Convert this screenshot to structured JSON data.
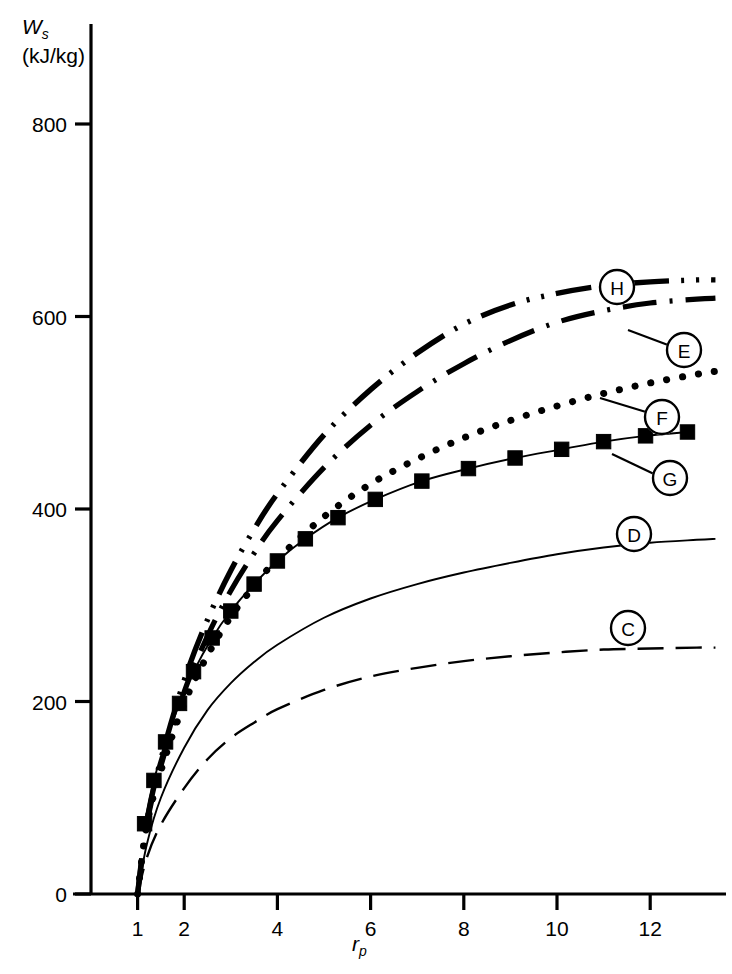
{
  "chart_data": {
    "type": "line",
    "title": "",
    "subtitle": "",
    "xlabel": "r_p",
    "xlabel_symbol": "r",
    "xlabel_subscript": "p",
    "ylabel": "W_s (kJ/kg)",
    "ylabel_symbol": "W",
    "ylabel_subscript": "s",
    "ylabel_units": "(kJ/kg)",
    "xlim": [
      0,
      13.6
    ],
    "ylim": [
      0,
      880
    ],
    "xticks": [
      1,
      2,
      4,
      6,
      8,
      10,
      12
    ],
    "xtick_labels": [
      "1",
      "2",
      "4",
      "6",
      "8",
      "10",
      "12"
    ],
    "yticks": [
      0,
      200,
      400,
      600,
      800
    ],
    "ytick_labels": [
      "0",
      "200",
      "400",
      "600",
      "800"
    ],
    "grid": false,
    "legend_position": "inline-callouts",
    "series": [
      {
        "name": "C",
        "label": "C",
        "style": "dashed-thin",
        "marker": "none",
        "x": [
          1,
          1.2,
          1.5,
          2,
          2.5,
          3,
          3.5,
          4,
          5,
          6,
          7,
          8,
          9,
          10,
          11,
          12,
          13,
          13.4
        ],
        "values": [
          0,
          38,
          72,
          110,
          140,
          162,
          178,
          192,
          212,
          226,
          235,
          242,
          247,
          251,
          254,
          255,
          256,
          256
        ]
      },
      {
        "name": "D",
        "label": "D",
        "style": "solid-thin",
        "marker": "none",
        "x": [
          1,
          1.2,
          1.5,
          2,
          2.5,
          3,
          3.5,
          4,
          5,
          6,
          7,
          8,
          9,
          10,
          11,
          12,
          13,
          13.4
        ],
        "values": [
          0,
          52,
          100,
          152,
          191,
          219,
          241,
          259,
          287,
          307,
          322,
          334,
          344,
          353,
          360,
          365,
          368,
          369
        ]
      },
      {
        "name": "G",
        "label": "G",
        "style": "solid-thin",
        "marker": "filled-square",
        "x": [
          1.15,
          1.35,
          1.6,
          1.9,
          2.2,
          2.6,
          3.0,
          3.5,
          4.0,
          4.6,
          5.3,
          6.1,
          7.1,
          8.1,
          9.1,
          10.1,
          11.0,
          11.9,
          12.8
        ],
        "values": [
          73,
          118,
          158,
          198,
          231,
          266,
          294,
          322,
          346,
          369,
          391,
          410,
          429,
          442,
          453,
          462,
          470,
          476,
          480
        ]
      },
      {
        "name": "F",
        "label": "F",
        "style": "dotted-thick",
        "marker": "none",
        "x": [
          1,
          1.2,
          1.5,
          2,
          2.5,
          3,
          3.5,
          4,
          5,
          6,
          7,
          8,
          9,
          10,
          11,
          12,
          13,
          13.4
        ],
        "values": [
          0,
          72,
          128,
          198,
          248,
          288,
          320,
          348,
          392,
          426,
          452,
          474,
          492,
          507,
          520,
          531,
          540,
          543
        ]
      },
      {
        "name": "E",
        "label": "E",
        "style": "dash-dot-thick",
        "marker": "none",
        "x": [
          1,
          1.2,
          1.5,
          2,
          2.5,
          3,
          3.5,
          4,
          5,
          6,
          7,
          8,
          9,
          10,
          11,
          12,
          13,
          13.4
        ],
        "values": [
          0,
          73,
          133,
          210,
          268,
          315,
          354,
          388,
          443,
          487,
          522,
          551,
          575,
          594,
          606,
          614,
          618,
          619
        ]
      },
      {
        "name": "H",
        "label": "H",
        "style": "dash-dot-dot-thick",
        "marker": "none",
        "x": [
          1,
          1.2,
          1.5,
          2,
          2.5,
          3,
          3.5,
          4,
          5,
          6,
          7,
          8,
          9,
          10,
          11,
          12,
          13,
          13.4
        ],
        "values": [
          0,
          76,
          140,
          222,
          285,
          336,
          379,
          416,
          477,
          524,
          562,
          592,
          612,
          624,
          632,
          636,
          638,
          638
        ]
      }
    ],
    "annotations": [
      {
        "label": "H",
        "cx": 617,
        "cy": 287,
        "leader": false
      },
      {
        "label": "E",
        "cx": 684,
        "cy": 350,
        "leader": true
      },
      {
        "label": "F",
        "cx": 662,
        "cy": 417,
        "leader": true
      },
      {
        "label": "G",
        "cx": 670,
        "cy": 478,
        "leader": true
      },
      {
        "label": "D",
        "cx": 634,
        "cy": 534,
        "leader": false
      },
      {
        "label": "C",
        "cx": 628,
        "cy": 628,
        "leader": false
      }
    ]
  }
}
